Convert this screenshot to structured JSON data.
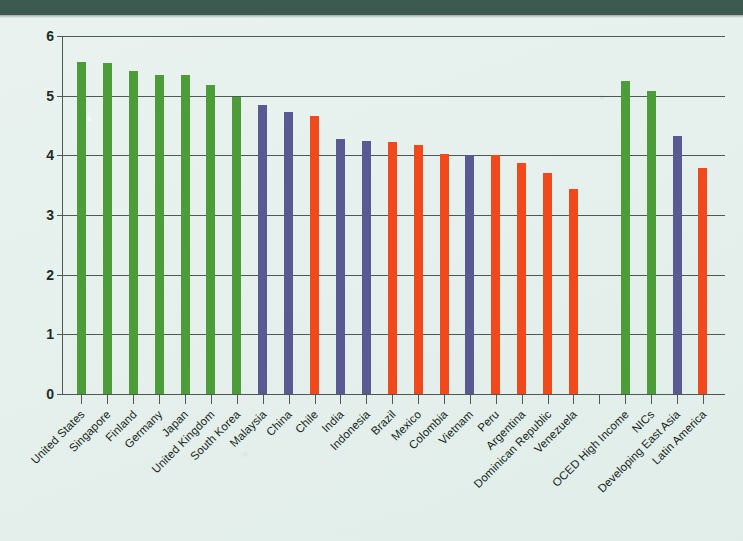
{
  "page": {
    "background_color": "#e2eeea",
    "top_band_color": "#3c5a50"
  },
  "chart_data": {
    "type": "bar",
    "title": "",
    "subtitle": "",
    "xlabel": "",
    "ylabel": "",
    "ylim": [
      0,
      6
    ],
    "yticks": [
      "0",
      "1",
      "2",
      "3",
      "4",
      "5",
      "6"
    ],
    "grid": true,
    "legend": "none",
    "colors": {
      "green": "#4d9c3a",
      "purple": "#5a5a93",
      "orange": "#f2491c"
    },
    "categories": [
      "United States",
      "Singapore",
      "Finland",
      "Germany",
      "Japan",
      "United Kingdom",
      "South Korea",
      "Malaysia",
      "China",
      "Chile",
      "India",
      "Indonesia",
      "Brazil",
      "Mexico",
      "Colombia",
      "Vietnam",
      "Peru",
      "Argentina",
      "Dominican Republic",
      "Venezuela",
      "",
      "OCED High Income",
      "NICs",
      "Developing East Asia",
      "Latin America"
    ],
    "values": [
      5.57,
      5.54,
      5.42,
      5.35,
      5.34,
      5.18,
      4.98,
      4.85,
      4.72,
      4.66,
      4.27,
      4.24,
      4.22,
      4.18,
      4.03,
      4.0,
      4.0,
      3.88,
      3.71,
      3.44,
      null,
      5.24,
      5.08,
      4.33,
      3.78
    ],
    "group_colors": [
      "green",
      "green",
      "green",
      "green",
      "green",
      "green",
      "green",
      "purple",
      "purple",
      "orange",
      "purple",
      "purple",
      "orange",
      "orange",
      "orange",
      "purple",
      "orange",
      "orange",
      "orange",
      "orange",
      null,
      "green",
      "green",
      "purple",
      "orange"
    ]
  }
}
